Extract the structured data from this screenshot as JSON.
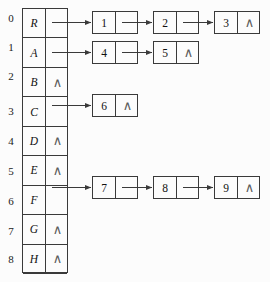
{
  "figure": {
    "nil_symbol": "∧"
  },
  "bucket_table": {
    "index_labels": [
      "0",
      "1",
      "2",
      "3",
      "4",
      "5",
      "6",
      "7",
      "8"
    ],
    "rows": [
      {
        "index": "0",
        "key": "R",
        "pointer": "link",
        "nil": ""
      },
      {
        "index": "1",
        "key": "A",
        "pointer": "link",
        "nil": ""
      },
      {
        "index": "2",
        "key": "B",
        "pointer": "nil",
        "nil": "∧"
      },
      {
        "index": "3",
        "key": "C",
        "pointer": "link",
        "nil": ""
      },
      {
        "index": "4",
        "key": "D",
        "pointer": "nil",
        "nil": "∧"
      },
      {
        "index": "5",
        "key": "E",
        "pointer": "nil",
        "nil": "∧"
      },
      {
        "index": "6",
        "key": "F",
        "pointer": "link",
        "nil": ""
      },
      {
        "index": "7",
        "key": "G",
        "pointer": "nil",
        "nil": "∧"
      },
      {
        "index": "8",
        "key": "H",
        "pointer": "nil",
        "nil": "∧"
      },
      {
        "index": "9",
        "key": "K",
        "pointer": "nil",
        "nil": "∧"
      }
    ]
  },
  "chains": [
    {
      "source_row": "R",
      "nodes": [
        {
          "value": "1",
          "next": "link",
          "nil": ""
        },
        {
          "value": "2",
          "next": "link",
          "nil": ""
        },
        {
          "value": "3",
          "next": "nil",
          "nil": "∧"
        }
      ]
    },
    {
      "source_row": "A",
      "nodes": [
        {
          "value": "4",
          "next": "link",
          "nil": ""
        },
        {
          "value": "5",
          "next": "nil",
          "nil": "∧"
        }
      ]
    },
    {
      "source_row": "C",
      "nodes": [
        {
          "value": "6",
          "next": "nil",
          "nil": "∧"
        }
      ]
    },
    {
      "source_row": "F",
      "nodes": [
        {
          "value": "7",
          "next": "link",
          "nil": ""
        },
        {
          "value": "8",
          "next": "link",
          "nil": ""
        },
        {
          "value": "9",
          "next": "nil",
          "nil": "∧"
        }
      ]
    }
  ],
  "colors": {
    "background": "#fcfcfc",
    "stroke": "#3a3a3a",
    "text": "#111111",
    "nil_text": "#5a5a5a"
  }
}
